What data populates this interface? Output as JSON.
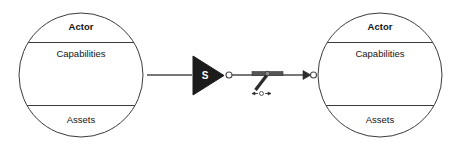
{
  "diagram": {
    "type": "actor-relationship-diagram",
    "background_color": "#ffffff",
    "stroke_color": "#3b3b3b",
    "fill_color": "#ffffff",
    "marker_fill_color": "#1c1c1c",
    "nodes": [
      {
        "id": "actor-left",
        "shape": "circle",
        "title": "Actor",
        "compartments": [
          "Capabilities",
          "Assets"
        ],
        "cx": 81,
        "cy": 75,
        "r": 62
      },
      {
        "id": "actor-right",
        "shape": "circle",
        "title": "Actor",
        "compartments": [
          "Capabilities",
          "Assets"
        ],
        "cx": 380,
        "cy": 75,
        "r": 62
      }
    ],
    "connector": {
      "label": "S",
      "source_node": "actor-left",
      "target_node": "actor-right",
      "source_marker": "filled-triangle-with-s",
      "midpoint_marker": "switch-lever",
      "target_marker": "arrow-head-with-open-circle"
    }
  }
}
